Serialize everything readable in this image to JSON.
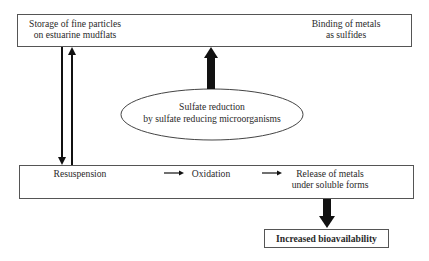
{
  "diagram": {
    "top_box": {
      "left_label": [
        "Storage of fine particles",
        "on estuarine mudflats"
      ],
      "right_label": [
        "Binding of metals",
        "as sulfides"
      ]
    },
    "ellipse": {
      "label": [
        "Sulfate reduction",
        "by sulfate reducing microorganisms"
      ]
    },
    "bottom_box": {
      "step1": "Resuspension",
      "step2": "Oxidation",
      "step3": [
        "Release of metals",
        "under soluble forms"
      ]
    },
    "outcome_box": {
      "label": "Increased bioavailability"
    },
    "arrows": [
      {
        "from": "top_box",
        "to": "bottom_box",
        "style": "thin",
        "direction": "down"
      },
      {
        "from": "bottom_box",
        "to": "top_box",
        "style": "thin",
        "direction": "up"
      },
      {
        "from": "ellipse",
        "to": "top_box",
        "style": "thick",
        "direction": "up"
      },
      {
        "from": "Resuspension",
        "to": "Oxidation",
        "style": "small",
        "direction": "right"
      },
      {
        "from": "Oxidation",
        "to": "Release of metals under soluble forms",
        "style": "small",
        "direction": "right"
      },
      {
        "from": "bottom_box",
        "to": "outcome_box",
        "style": "thick",
        "direction": "down"
      }
    ],
    "colors": {
      "stroke": "#555555",
      "arrow": "#111111",
      "background": "#ffffff"
    }
  }
}
